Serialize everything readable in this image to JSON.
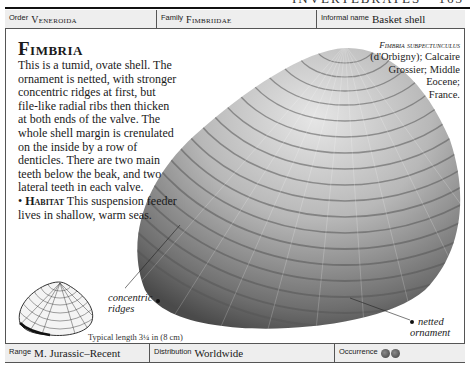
{
  "page": {
    "running_head": "INVERTEBRATES",
    "page_number": "163"
  },
  "header": {
    "order_label": "Order",
    "order_value": "Veneroida",
    "family_label": "Family",
    "family_value": "Fimbriidae",
    "informal_label": "Informal name",
    "informal_value": "Basket shell"
  },
  "main": {
    "title": "Fimbria",
    "description": "This is a tumid, ovate shell. The ornament is netted, with stronger concentric ridges at first, but file-like radial ribs then thicken at both ends of the valve. The whole shell margin is crenulated on the inside by a row of denticles. There are two main teeth below the beak, and two lateral teeth in each valve.",
    "habitat_bullet": "•",
    "habitat_heading": "Habitat",
    "habitat_text": "This suspension feeder lives in shallow, warm seas."
  },
  "specimen_caption": {
    "species": "Fimbria subpectunculus",
    "line1": "(d'Orbigny); Calcaire",
    "line2": "Grossier; Middle",
    "line3": "Eocene;",
    "line4": "France."
  },
  "annotations": {
    "concentric_line1": "concentric",
    "concentric_line2": "ridges",
    "netted_line1": "netted",
    "netted_line2": "ornament",
    "typical_length": "Typical length 3¼ in (8 cm)"
  },
  "footer": {
    "range_label": "Range",
    "range_value": "M. Jurassic–Recent",
    "distribution_label": "Distribution",
    "distribution_value": "Worldwide",
    "occurrence_label": "Occurrence",
    "occurrence_count": 2
  },
  "colors": {
    "band_bg": "#eeeeee",
    "rule": "#111111",
    "shell_light": "#d9d9d9",
    "shell_dark": "#5a5a5a"
  }
}
